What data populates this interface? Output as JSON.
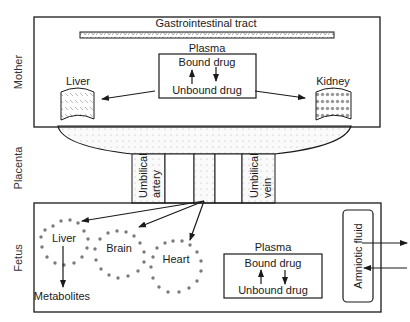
{
  "sections": {
    "mother": "Mother",
    "placenta": "Placenta",
    "fetus": "Fetus"
  },
  "mother": {
    "gi_tract": "Gastrointestinal tract",
    "plasma": {
      "title": "Plasma",
      "bound": "Bound drug",
      "unbound": "Unbound drug"
    },
    "liver": "Liver",
    "kidney": "Kidney"
  },
  "cord": {
    "artery_line1": "Umbilical",
    "artery_line2": "artery",
    "vein_line1": "Umbilical",
    "vein_line2": "vein"
  },
  "fetus": {
    "liver": "Liver",
    "brain": "Brain",
    "heart": "Heart",
    "metabolites": "Metabolites",
    "plasma": {
      "title": "Plasma",
      "bound": "Bound drug",
      "unbound": "Unbound drug"
    },
    "amniotic": "Amniotic fluid"
  },
  "colors": {
    "stroke": "#1a1a1a",
    "organ_dots": "#7a7a7a",
    "placenta_fill": "#f4f4f4"
  }
}
